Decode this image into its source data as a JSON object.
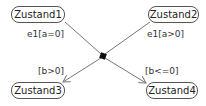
{
  "diagram": {
    "type": "uml-state-diagram",
    "states": [
      {
        "id": "s1",
        "label": "Zustand1"
      },
      {
        "id": "s2",
        "label": "Zustand2"
      },
      {
        "id": "s3",
        "label": "Zustand3"
      },
      {
        "id": "s4",
        "label": "Zustand4"
      }
    ],
    "junction": {
      "type": "junction-point"
    },
    "transitions": [
      {
        "from": "Zustand1",
        "to": "junction",
        "label": "e1[a=0]"
      },
      {
        "from": "Zustand2",
        "to": "junction",
        "label": "e1[a>0]"
      },
      {
        "from": "junction",
        "to": "Zustand3",
        "label": "[b>0]"
      },
      {
        "from": "junction",
        "to": "Zustand4",
        "label": "[b<=0]"
      }
    ],
    "colors": {
      "line": "#777777",
      "border": "#555555",
      "junction": "#111111"
    }
  }
}
